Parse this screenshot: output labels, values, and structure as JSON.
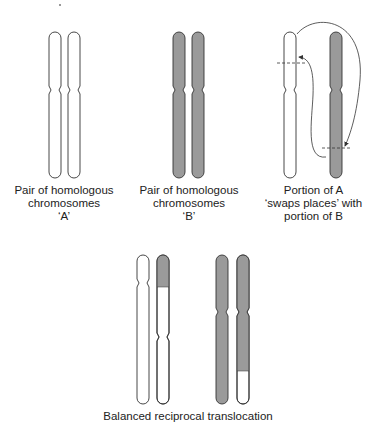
{
  "colors": {
    "shaded": "#9a9a9a",
    "outline": "#333333",
    "white": "#ffffff"
  },
  "panels": {
    "pair_a": {
      "label_line1": "Pair of homologous",
      "label_line2": "chromosomes",
      "label_line3": "‘A’"
    },
    "pair_b": {
      "label_line1": "Pair of homologous",
      "label_line2": "chromosomes",
      "label_line3": "‘B’"
    },
    "swap": {
      "label_line1": "Portion of A",
      "label_line2": "‘swaps places’ with",
      "label_line3": "portion of B"
    },
    "result": {
      "label": "Balanced reciprocal translocation"
    }
  }
}
